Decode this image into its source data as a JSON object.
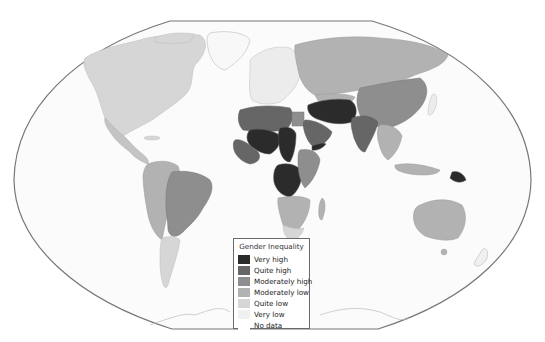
{
  "map": {
    "title": "Gender Inequality",
    "projection": "Winkel-style world map",
    "background": "#ffffff",
    "ocean_color": "#fbfbfb",
    "border_color": "#777777"
  },
  "legend": {
    "title": "Gender Inequality",
    "items": [
      {
        "label": "Very high",
        "color": "#2b2b2b"
      },
      {
        "label": "Quite high",
        "color": "#666666"
      },
      {
        "label": "Moderately high",
        "color": "#8e8e8e"
      },
      {
        "label": "Moderately low",
        "color": "#b2b2b2"
      },
      {
        "label": "Quite low",
        "color": "#d6d6d6"
      },
      {
        "label": "Very low",
        "color": "#f0f0f0"
      },
      {
        "label": "No data",
        "color": "#ffffff"
      }
    ]
  },
  "regions": [
    {
      "name": "North America",
      "category": "Quite low"
    },
    {
      "name": "Greenland",
      "category": "No data"
    },
    {
      "name": "Central America",
      "category": "Moderately low"
    },
    {
      "name": "South America (west)",
      "category": "Moderately low"
    },
    {
      "name": "Brazil",
      "category": "Quite high"
    },
    {
      "name": "Southern cone",
      "category": "Quite low"
    },
    {
      "name": "Europe",
      "category": "Very low"
    },
    {
      "name": "Russia",
      "category": "Moderately low"
    },
    {
      "name": "North Africa",
      "category": "Quite high"
    },
    {
      "name": "Sahel / Central Africa",
      "category": "Very high"
    },
    {
      "name": "East Africa",
      "category": "Moderately high"
    },
    {
      "name": "Southern Africa",
      "category": "Moderately low"
    },
    {
      "name": "Middle East",
      "category": "Very high"
    },
    {
      "name": "Arabian Peninsula",
      "category": "Quite high"
    },
    {
      "name": "India",
      "category": "Quite high"
    },
    {
      "name": "China",
      "category": "Moderately high"
    },
    {
      "name": "Southeast Asia",
      "category": "Moderately low"
    },
    {
      "name": "Papua New Guinea",
      "category": "Very high"
    },
    {
      "name": "Australia",
      "category": "Moderately low"
    },
    {
      "name": "Antarctica",
      "category": "No data"
    }
  ]
}
